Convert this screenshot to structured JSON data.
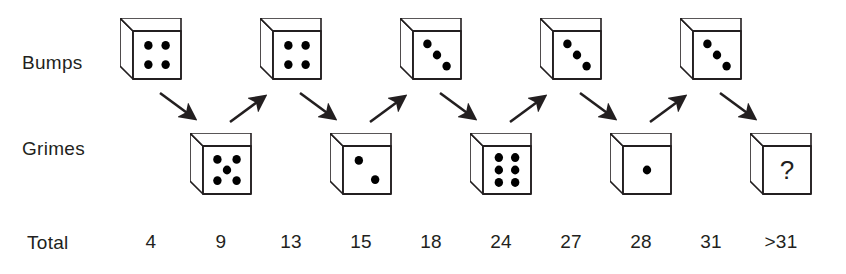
{
  "rows": {
    "bumps_label": "Bumps",
    "grimes_label": "Grimes",
    "total_label": "Total"
  },
  "chart_data": {
    "type": "diagram",
    "players": [
      "Bumps",
      "Grimes"
    ],
    "sequence_labels": [
      "Total"
    ],
    "bumps_rolls": [
      4,
      4,
      3,
      3,
      3
    ],
    "grimes_rolls": [
      5,
      2,
      6,
      1,
      null
    ],
    "grimes_last_is_unknown": true,
    "unknown_symbol": "?",
    "turn_order": [
      "Bumps",
      "Grimes",
      "Bumps",
      "Grimes",
      "Bumps",
      "Grimes",
      "Bumps",
      "Grimes",
      "Bumps",
      "Grimes"
    ],
    "totals": [
      "4",
      "9",
      "13",
      "15",
      "18",
      "24",
      "27",
      "28",
      "31",
      ">31"
    ],
    "arrow_directions": [
      "down-right",
      "up-right",
      "down-right",
      "up-right",
      "down-right",
      "up-right",
      "down-right",
      "up-right",
      "down-right"
    ],
    "colors": {
      "ink": "#231f20",
      "pip": "#000000",
      "die_face": "#ffffff",
      "background": "#ffffff"
    }
  },
  "dice": {
    "bumps": [
      {
        "name": "bumps-die-1",
        "pips": 4,
        "value_label": "4"
      },
      {
        "name": "bumps-die-2",
        "pips": 4,
        "value_label": "4"
      },
      {
        "name": "bumps-die-3",
        "pips": 3,
        "value_label": "3"
      },
      {
        "name": "bumps-die-4",
        "pips": 3,
        "value_label": "3"
      },
      {
        "name": "bumps-die-5",
        "pips": 3,
        "value_label": "3"
      }
    ],
    "grimes": [
      {
        "name": "grimes-die-1",
        "pips": 5,
        "value_label": "5"
      },
      {
        "name": "grimes-die-2",
        "pips": 2,
        "value_label": "2"
      },
      {
        "name": "grimes-die-3",
        "pips": 6,
        "value_label": "6"
      },
      {
        "name": "grimes-die-4",
        "pips": 1,
        "value_label": "1"
      },
      {
        "name": "grimes-die-5",
        "pips": 0,
        "value_label": "?"
      }
    ]
  },
  "totals": {
    "values": [
      "4",
      "9",
      "13",
      "15",
      "18",
      "24",
      "27",
      "28",
      "31",
      ">31"
    ]
  }
}
